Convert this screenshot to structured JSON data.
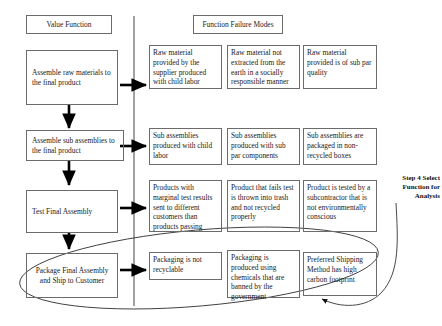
{
  "diagram": {
    "columns": {
      "value_function_header": "Value Function",
      "failure_modes_header": "Function Failure Modes"
    },
    "value_functions": [
      "Assemble raw materials to the final product",
      "Assemble sub assemblies to the final product",
      "Test Final Assembly",
      "Package Final Assembly and Ship to Customer"
    ],
    "failure_modes": {
      "row1": [
        "Raw material provided by the supplier produced with child labor",
        "Raw material not extracted from the earth in a socially responsible manner",
        "Raw material provided is of sub par quality"
      ],
      "row2": [
        "Sub assemblies produced with child labor",
        "Sub assemblies produced with sub par components",
        "Sub assemblies are packaged in non-recycled boxes"
      ],
      "row3": [
        "Products with marginal test results sent to different customers than products passing",
        "Product that fails test is thrown into trash and not recycled properly",
        "Product is tested by a subcontractor that is not environmentally conscious"
      ],
      "row4": [
        "Packaging is not recyclable",
        "Packaging is produced using chemicals that are banned by the government",
        "Preferred Shipping Method has high carbon footprint"
      ]
    },
    "annotation": {
      "line1": "Step 4 Select",
      "line2": "Function for",
      "line3": "Analysis"
    },
    "colors": {
      "stroke": "#6b6b6b",
      "ink": "#1a1a1a",
      "arrow": "#000000"
    }
  }
}
